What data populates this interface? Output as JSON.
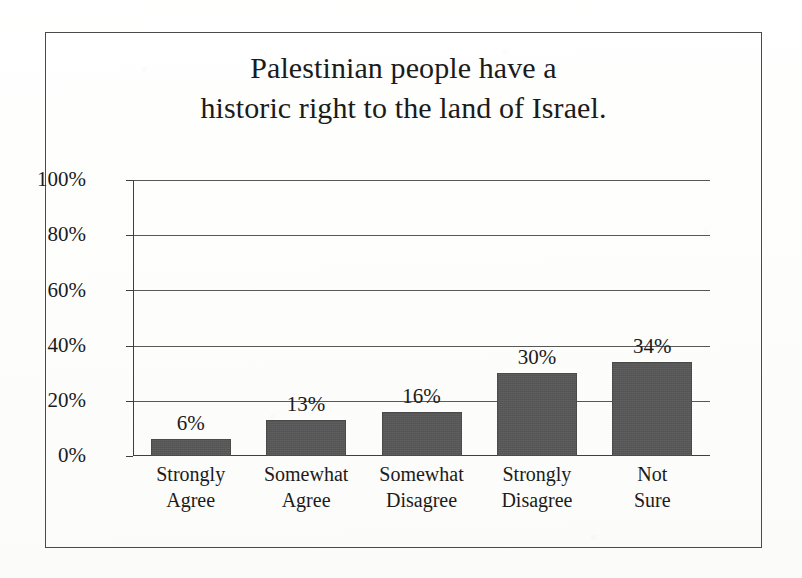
{
  "figure": {
    "background_color": "#fdfdfc",
    "frame_color": "#4a4a4a",
    "text_color": "#1b1b1b"
  },
  "title": {
    "line1": "Palestinian people have a",
    "line2": "historic right to the land of Israel."
  },
  "chart_data": {
    "type": "bar",
    "title": "Palestinian people have a historic right to the land of Israel.",
    "xlabel": "",
    "ylabel": "",
    "categories": [
      "Strongly Agree",
      "Somewhat Agree",
      "Somewhat Disagree",
      "Strongly Disagree",
      "Not Sure"
    ],
    "category_lines": [
      [
        "Strongly",
        "Agree"
      ],
      [
        "Somewhat",
        "Agree"
      ],
      [
        "Somewhat",
        "Disagree"
      ],
      [
        "Strongly",
        "Disagree"
      ],
      [
        "Not",
        "Sure"
      ]
    ],
    "values": [
      6,
      13,
      16,
      30,
      34
    ],
    "value_labels": [
      "6%",
      "13%",
      "16%",
      "30%",
      "34%"
    ],
    "ylim": [
      0,
      100
    ],
    "yticks": [
      0,
      20,
      40,
      60,
      80,
      100
    ],
    "ytick_labels": [
      "0%",
      "20%",
      "40%",
      "60%",
      "80%",
      "100%"
    ],
    "grid": true,
    "legend": false,
    "bar_color": "#575757",
    "bar_edge_color": "#4b4b4b",
    "gridline_color": "#585858"
  }
}
